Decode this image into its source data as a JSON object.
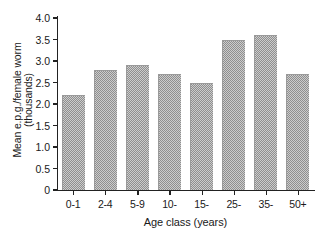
{
  "chart_data": {
    "type": "bar",
    "title": "",
    "subtitle": "",
    "xlabel": "Age class (years)",
    "ylabel": "Mean e.p.g./female worm\n(thousands)",
    "categories": [
      "0-1",
      "2-4",
      "5-9",
      "10-",
      "15-",
      "25-",
      "35-",
      "50+"
    ],
    "values": [
      2.2,
      2.8,
      2.9,
      2.7,
      2.5,
      3.5,
      3.6,
      2.7
    ],
    "ylim": [
      0,
      4.0
    ],
    "yticks": [
      "0",
      "0.5",
      "1.0",
      "1.5",
      "2.0",
      "2.5",
      "3.0",
      "3.5",
      "4.0"
    ],
    "ytick_values": [
      0,
      0.5,
      1.0,
      1.5,
      2.0,
      2.5,
      3.0,
      3.5,
      4.0
    ],
    "grid": false,
    "legend": null,
    "legend_position": "none",
    "series": [
      {
        "name": "Mean e.p.g. per female worm",
        "values": [
          2.2,
          2.8,
          2.9,
          2.7,
          2.5,
          3.5,
          3.6,
          2.7
        ]
      }
    ],
    "bar_color": "#8f8f8f",
    "bar_fill_pattern": "checkered-dither-gray",
    "axis_color": "#222222",
    "background_color": "#ffffff"
  }
}
